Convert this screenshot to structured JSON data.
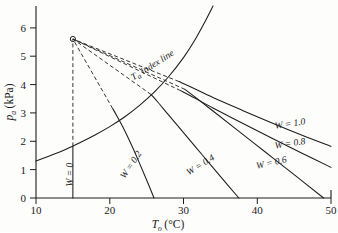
{
  "figure": {
    "title": "",
    "background_color": "#fdfdfc",
    "line_color": "#1c1c1c"
  },
  "axes": {
    "x": {
      "label_symbol": "T",
      "label_subscript": "o",
      "label_unit": "(°C)",
      "label_full": "To (°C)",
      "ticks": [
        "10",
        "20",
        "30",
        "40",
        "50"
      ],
      "tick_values": [
        10,
        20,
        30,
        40,
        50
      ],
      "range": [
        10,
        50
      ]
    },
    "y": {
      "label_symbol": "p",
      "label_subscript": "a",
      "label_unit": "(kPa)",
      "label_full": "pa (kPa)",
      "ticks": [
        "0",
        "1",
        "2",
        "3",
        "4",
        "5",
        "6"
      ],
      "tick_values": [
        0,
        1,
        2,
        3,
        4,
        5,
        6
      ],
      "range": [
        0,
        6.4
      ]
    }
  },
  "annotations": {
    "index_line_label": "T  index line",
    "index_line_symbol": "T",
    "index_line_subscript": "a",
    "index_line_rest": "index line",
    "w_zero_label": "W = 0",
    "convergence_marker": "open-circle"
  },
  "chart_data": {
    "type": "line",
    "title": "",
    "xlabel": "To (°C)",
    "ylabel": "pa (kPa)",
    "xlim": [
      10,
      50
    ],
    "ylim": [
      0,
      6.4
    ],
    "grid": false,
    "legend": "inline-labels",
    "convergence_point": {
      "x": 15.0,
      "y": 5.3
    },
    "series": [
      {
        "name": "Ta index line",
        "style": "solid",
        "label": "T  index line",
        "points": [
          [
            10.0,
            1.23
          ],
          [
            12.0,
            1.42
          ],
          [
            14.0,
            1.62
          ],
          [
            16.0,
            1.85
          ],
          [
            18.0,
            2.1
          ],
          [
            20.0,
            2.38
          ],
          [
            22.0,
            2.7
          ],
          [
            24.0,
            3.08
          ],
          [
            26.0,
            3.52
          ],
          [
            28.0,
            4.05
          ],
          [
            30.0,
            4.68
          ],
          [
            31.5,
            5.25
          ],
          [
            33.0,
            5.92
          ],
          [
            34.0,
            6.4
          ]
        ]
      },
      {
        "name": "W = 0",
        "style": "solid-vertical",
        "label": "W = 0",
        "points": [
          [
            15.0,
            0.0
          ],
          [
            15.0,
            1.72
          ]
        ]
      },
      {
        "name": "W = 0 upper dashed",
        "style": "dashed",
        "label": "",
        "points": [
          [
            15.0,
            1.72
          ],
          [
            15.0,
            5.3
          ]
        ]
      },
      {
        "name": "W = 0.2",
        "style": "solid",
        "label": "W = 0.2",
        "points": [
          [
            26.0,
            0.0
          ],
          [
            25.0,
            0.6
          ],
          [
            24.0,
            1.18
          ],
          [
            23.0,
            1.74
          ],
          [
            22.0,
            2.26
          ],
          [
            21.0,
            2.72
          ],
          [
            20.4,
            2.98
          ]
        ]
      },
      {
        "name": "W = 0.2 dashed",
        "style": "dashed",
        "label": "",
        "points": [
          [
            20.4,
            2.98
          ],
          [
            15.0,
            5.3
          ]
        ]
      },
      {
        "name": "W = 0.4",
        "style": "solid",
        "label": "W = 0.4",
        "points": [
          [
            37.5,
            0.0
          ],
          [
            35.0,
            0.72
          ],
          [
            32.5,
            1.45
          ],
          [
            30.0,
            2.18
          ],
          [
            28.0,
            2.76
          ],
          [
            26.5,
            3.2
          ],
          [
            25.6,
            3.45
          ]
        ]
      },
      {
        "name": "W = 0.4 dashed",
        "style": "dashed",
        "label": "",
        "points": [
          [
            25.6,
            3.45
          ],
          [
            15.0,
            5.3
          ]
        ]
      },
      {
        "name": "W = 0.6",
        "style": "solid",
        "label": "W = 0.6",
        "points": [
          [
            49.0,
            0.0
          ],
          [
            45.0,
            0.78
          ],
          [
            41.0,
            1.55
          ],
          [
            37.0,
            2.32
          ],
          [
            34.0,
            2.9
          ],
          [
            31.5,
            3.38
          ],
          [
            30.2,
            3.62
          ]
        ]
      },
      {
        "name": "W = 0.6 dashed",
        "style": "dashed",
        "label": "",
        "points": [
          [
            30.2,
            3.62
          ],
          [
            15.0,
            5.3
          ]
        ]
      },
      {
        "name": "W = 0.8",
        "style": "solid",
        "label": "W = 0.8",
        "points": [
          [
            50.0,
            1.02
          ],
          [
            46.0,
            1.5
          ],
          [
            42.0,
            1.99
          ],
          [
            38.0,
            2.49
          ],
          [
            34.0,
            3.0
          ],
          [
            31.0,
            3.4
          ],
          [
            29.6,
            3.58
          ]
        ]
      },
      {
        "name": "W = 0.8 dashed",
        "style": "dashed",
        "label": "",
        "points": [
          [
            29.6,
            3.58
          ],
          [
            15.0,
            5.3
          ]
        ]
      },
      {
        "name": "W = 1.0",
        "style": "solid",
        "label": "W = 1.0",
        "points": [
          [
            50.0,
            1.72
          ],
          [
            46.0,
            2.1
          ],
          [
            42.0,
            2.5
          ],
          [
            38.0,
            2.92
          ],
          [
            34.0,
            3.35
          ],
          [
            31.0,
            3.7
          ],
          [
            29.4,
            3.88
          ]
        ]
      },
      {
        "name": "W = 1.0 dashed",
        "style": "dashed",
        "label": "",
        "points": [
          [
            29.4,
            3.88
          ],
          [
            15.0,
            5.3
          ]
        ]
      }
    ],
    "curve_labels": [
      {
        "text": "W = 1.0",
        "x": 44.5,
        "y": 2.38,
        "rotation": -9
      },
      {
        "text": "W = 0.8",
        "x": 44.5,
        "y": 1.72,
        "rotation": -9
      },
      {
        "text": "W = 0.6",
        "x": 42.0,
        "y": 1.08,
        "rotation": -13
      },
      {
        "text": "W = 0.4",
        "x": 32.5,
        "y": 1.02,
        "rotation": -32
      },
      {
        "text": "W = 0.2",
        "x": 23.2,
        "y": 1.05,
        "rotation": -56
      },
      {
        "text": "W = 0",
        "x": 15.0,
        "y": 0.78,
        "rotation": -90
      },
      {
        "text": "T  index line",
        "x": 26.0,
        "y": 4.35,
        "rotation": -32
      }
    ]
  }
}
